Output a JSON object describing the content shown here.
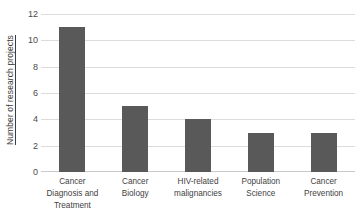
{
  "chart_data": {
    "type": "bar",
    "title": "",
    "subtitle": "",
    "xlabel": "",
    "ylabel": "Number of research projects",
    "ylim": [
      0,
      12
    ],
    "ytick_step": 2,
    "yticks": [
      12,
      10,
      8,
      6,
      4,
      2,
      0
    ],
    "grid": "horizontal",
    "legend": "none",
    "bar_color": "#595959",
    "gridline_color": "#dcdcdc",
    "background_color": "#ffffff",
    "categories": [
      "Cancer Diagnosis and Treatment",
      "Cancer Biology",
      "HIV-related malignancies",
      "Population Science",
      "Cancer Prevention"
    ],
    "category_lines": [
      [
        "Cancer",
        "Diagnosis and",
        "Treatment"
      ],
      [
        "Cancer",
        "Biology"
      ],
      [
        "HIV-related",
        "malignancies"
      ],
      [
        "Population",
        "Science"
      ],
      [
        "Cancer",
        "Prevention"
      ]
    ],
    "values": [
      11,
      5,
      4,
      3,
      3
    ]
  }
}
